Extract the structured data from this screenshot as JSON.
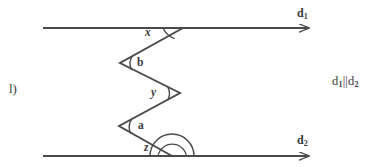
{
  "figure": {
    "item_label": "l)",
    "relation": {
      "text": "d₁||d₂",
      "line1": "d",
      "line1_sub": "1",
      "separator": "||",
      "line2": "d",
      "line2_sub": "2"
    },
    "lines": [
      {
        "name": "d1",
        "base": "d",
        "sub": "1",
        "label": "d₁",
        "y": 28,
        "x_start": 43,
        "x_end": 316
      },
      {
        "name": "d2",
        "base": "d",
        "sub": "2",
        "label": "d₂",
        "y": 156,
        "x_start": 43,
        "x_end": 316
      }
    ],
    "angles": [
      {
        "id": "x",
        "label": "x",
        "at": "intersection-with-d1",
        "style": "italic"
      },
      {
        "id": "b",
        "label": "b",
        "at": "zigzag-vertex-upper-left",
        "style": "bold"
      },
      {
        "id": "y",
        "label": "y",
        "at": "zigzag-vertex-middle-right",
        "style": "italic"
      },
      {
        "id": "a",
        "label": "a",
        "at": "zigzag-vertex-lower-left",
        "style": "bold"
      },
      {
        "id": "z",
        "label": "z",
        "at": "intersection-with-d2",
        "style": "italic"
      }
    ],
    "zigzag_points": [
      {
        "x": 183,
        "y": 28
      },
      {
        "x": 120,
        "y": 63
      },
      {
        "x": 180,
        "y": 93
      },
      {
        "x": 119,
        "y": 126
      },
      {
        "x": 172,
        "y": 156
      }
    ],
    "colors": {
      "stroke": "#4a4a4a",
      "text": "#3a3a3a",
      "background": "#ffffff"
    }
  }
}
